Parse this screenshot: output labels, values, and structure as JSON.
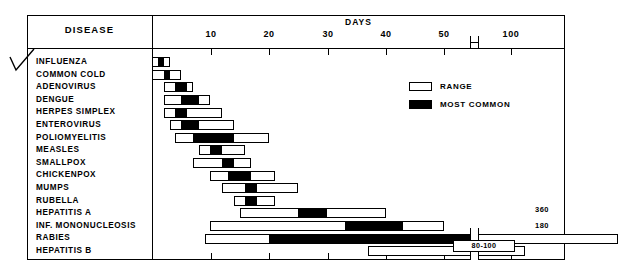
{
  "table": {
    "disease_header": "DISEASE",
    "days_header": "DAYS"
  },
  "legend": {
    "items": [
      {
        "label": "RANGE",
        "swatch": "white-box-icon"
      },
      {
        "label": "MOST COMMON",
        "swatch": "black-box-icon"
      }
    ]
  },
  "axis": {
    "tick_labels": [
      "10",
      "20",
      "30",
      "40",
      "50",
      "100"
    ],
    "break_marker": "axis-break-icon"
  },
  "annotations": {
    "rabies_max": "360",
    "hepatitis_b_max": "180",
    "hepatitis_b_common": "80-100"
  },
  "chart_data": {
    "type": "bar",
    "title": "DAYS",
    "xlabel": "DAYS",
    "ylabel": "DISEASE",
    "orientation": "horizontal",
    "grid": false,
    "legend_position": "top-right",
    "xlim": [
      0,
      100
    ],
    "axis_break": {
      "after": 52,
      "before": 90
    },
    "xticks": [
      10,
      20,
      30,
      40,
      50,
      100
    ],
    "categories": [
      "INFLUENZA",
      "COMMON COLD",
      "ADENOVIRUS",
      "DENGUE",
      "HERPES SIMPLEX",
      "ENTEROVIRUS",
      "POLIOMYELITIS",
      "MEASLES",
      "SMALLPOX",
      "CHICKENPOX",
      "MUMPS",
      "RUBELLA",
      "HEPATITIS A",
      "INF. MONONUCLEOSIS",
      "RABIES",
      "HEPATITIS B"
    ],
    "series": [
      {
        "name": "RANGE",
        "note": "full incubation period range in days [min, max]",
        "values": [
          [
            0,
            3
          ],
          [
            0,
            5
          ],
          [
            2,
            7
          ],
          [
            2,
            10
          ],
          [
            2,
            12
          ],
          [
            3,
            14
          ],
          [
            4,
            20
          ],
          [
            8,
            16
          ],
          [
            7,
            17
          ],
          [
            10,
            21
          ],
          [
            12,
            25
          ],
          [
            14,
            21
          ],
          [
            15,
            40
          ],
          [
            10,
            50
          ],
          [
            9,
            360
          ],
          [
            37,
            180
          ]
        ]
      },
      {
        "name": "MOST COMMON",
        "note": "most common incubation period in days [min, max]",
        "values": [
          [
            1,
            2
          ],
          [
            2,
            3
          ],
          [
            4,
            6
          ],
          [
            5,
            8
          ],
          [
            4,
            6
          ],
          [
            5,
            8
          ],
          [
            7,
            14
          ],
          [
            10,
            12
          ],
          [
            12,
            14
          ],
          [
            13,
            17
          ],
          [
            16,
            18
          ],
          [
            16,
            18
          ],
          [
            25,
            30
          ],
          [
            33,
            43
          ],
          [
            20,
            90
          ],
          [
            60,
            90
          ]
        ]
      }
    ]
  }
}
